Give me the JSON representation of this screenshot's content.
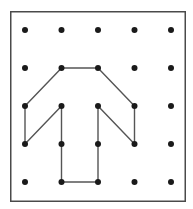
{
  "figure": {
    "kind": "geoboard-figure",
    "caption_fragment": "",
    "board": {
      "name": "geoboard",
      "rows": 5,
      "cols": 5,
      "frame": {
        "x": 10,
        "y": 11,
        "width": 176,
        "height": 191,
        "border_color": "#4a4a4a",
        "border_width": 1.5,
        "fill_color": "#ffffff"
      },
      "peg": {
        "radius": 3,
        "color": "#1a1a1a",
        "origin_x": 25,
        "origin_y": 30,
        "step_x": 36.5,
        "step_y": 38
      },
      "peg_grid_labels": [
        [
          "r1c1",
          "r1c2",
          "r1c3",
          "r1c4",
          "r1c5"
        ],
        [
          "r2c1",
          "r2c2",
          "r2c3",
          "r2c4",
          "r2c5"
        ],
        [
          "r3c1",
          "r3c2",
          "r3c3",
          "r3c4",
          "r3c5"
        ],
        [
          "r4c1",
          "r4c2",
          "r4c3",
          "r4c4",
          "r4c5"
        ],
        [
          "r5c1",
          "r5c2",
          "r5c3",
          "r5c4",
          "r5c5"
        ]
      ]
    },
    "shape": {
      "name": "arrow-outline",
      "description": "upward arrow band outline on pegs",
      "stroke_color": "#555555",
      "stroke_width": 1.4,
      "fill": "none",
      "closed": true,
      "vertices_rc": [
        [
          2,
          2
        ],
        [
          2,
          3
        ],
        [
          3,
          4
        ],
        [
          4,
          4
        ],
        [
          3,
          3
        ],
        [
          5,
          3
        ],
        [
          5,
          2
        ],
        [
          3,
          2
        ],
        [
          4,
          1
        ],
        [
          3,
          1
        ]
      ]
    },
    "marked_vertex_rc": [
      [
        2,
        2
      ],
      [
        2,
        3
      ],
      [
        3,
        1
      ],
      [
        3,
        2
      ],
      [
        3,
        3
      ],
      [
        3,
        4
      ],
      [
        4,
        1
      ],
      [
        4,
        2
      ],
      [
        4,
        3
      ],
      [
        4,
        4
      ],
      [
        5,
        2
      ],
      [
        5,
        3
      ]
    ]
  }
}
